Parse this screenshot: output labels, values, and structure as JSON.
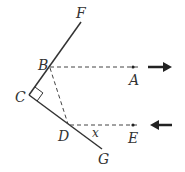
{
  "diagram": {
    "type": "geometry-reflection",
    "labels": {
      "F": "F",
      "B": "B",
      "C": "C",
      "D": "D",
      "G": "G",
      "A": "A",
      "E": "E",
      "angle": "x"
    },
    "points": {
      "F": [
        81,
        22
      ],
      "B": [
        49,
        67
      ],
      "C": [
        29,
        95
      ],
      "D": [
        68,
        125
      ],
      "G": [
        102,
        149
      ],
      "A": [
        133,
        67
      ],
      "E": [
        133,
        125
      ]
    },
    "colors": {
      "line": "#333333",
      "background": "#ffffff"
    },
    "right_angle_at": "C",
    "arrows": [
      {
        "name": "outgoing-arrow",
        "direction": "right",
        "row": "BA"
      },
      {
        "name": "incoming-arrow",
        "direction": "left",
        "row": "DE"
      }
    ]
  }
}
